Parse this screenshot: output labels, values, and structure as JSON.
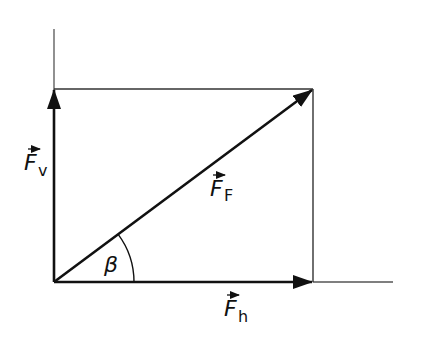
{
  "diagram": {
    "type": "vector-decomposition",
    "colors": {
      "stroke": "#111111",
      "background": "#ffffff"
    },
    "labels": {
      "vertical": {
        "symbol": "F",
        "subscript": "v",
        "vector_arrow": true
      },
      "resultant": {
        "symbol": "F",
        "subscript": "F",
        "vector_arrow": true
      },
      "horizontal": {
        "symbol": "F",
        "subscript": "h",
        "vector_arrow": true
      },
      "angle": "β"
    },
    "geometry": {
      "origin": [
        54,
        282
      ],
      "corner": [
        313,
        89
      ],
      "vertical_axis_top": 29,
      "horizontal_axis_end": 393,
      "angle_arc_radius": 80
    }
  }
}
